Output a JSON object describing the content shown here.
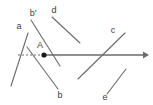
{
  "figure": {
    "type": "geometry-diagram",
    "width": 153,
    "height": 105,
    "background": "#ffffff",
    "stroke_color": "#6b6b6b",
    "text_color": "#3c3c3c",
    "labels": [
      {
        "id": "label-a",
        "text": "a",
        "x": 19,
        "y": 26
      },
      {
        "id": "label-b-prime",
        "text": "b'",
        "x": 33,
        "y": 13
      },
      {
        "id": "label-d",
        "text": "d",
        "x": 54,
        "y": 10
      },
      {
        "id": "label-A",
        "text": "A",
        "x": 40,
        "y": 45
      },
      {
        "id": "label-b",
        "text": "b",
        "x": 60,
        "y": 95
      },
      {
        "id": "label-c",
        "text": "c",
        "x": 113,
        "y": 30
      },
      {
        "id": "label-e",
        "text": "e",
        "x": 105,
        "y": 97
      }
    ],
    "segments": [
      {
        "id": "line-a",
        "x1": 28,
        "y1": 33,
        "x2": 11,
        "y2": 86,
        "stroke": "#6b6b6b",
        "width": 1.1,
        "dash": "none"
      },
      {
        "id": "line-b-prime",
        "x1": 31,
        "y1": 20,
        "x2": 60,
        "y2": 66,
        "stroke": "#6b6b6b",
        "width": 1.1,
        "dash": "none"
      },
      {
        "id": "line-b",
        "x1": 27,
        "y1": 47,
        "x2": 58,
        "y2": 89,
        "stroke": "#6b6b6b",
        "width": 1.1,
        "dash": "none"
      },
      {
        "id": "line-d",
        "x1": 52,
        "y1": 17,
        "x2": 80,
        "y2": 43,
        "stroke": "#6b6b6b",
        "width": 1.1,
        "dash": "none"
      },
      {
        "id": "line-c",
        "x1": 78,
        "y1": 79,
        "x2": 125,
        "y2": 33,
        "stroke": "#6b6b6b",
        "width": 1.1,
        "dash": "none"
      },
      {
        "id": "line-e",
        "x1": 107,
        "y1": 94,
        "x2": 126,
        "y2": 69,
        "stroke": "#6b6b6b",
        "width": 1.1,
        "dash": "none"
      },
      {
        "id": "ray-dashed",
        "x1": 18,
        "y1": 55,
        "x2": 44,
        "y2": 55,
        "stroke": "#6b6b6b",
        "width": 1.0,
        "dash": "2 2"
      }
    ],
    "arrow": {
      "id": "ray-arrow",
      "x1": 43,
      "y1": 55,
      "x2": 149,
      "y2": 55,
      "stroke": "#6b6b6b",
      "width": 1.6,
      "head_width": 7,
      "head_height": 6
    },
    "point": {
      "id": "point-A",
      "x": 44,
      "y": 55,
      "radius": 2.6,
      "fill": "#1a1a1a"
    }
  }
}
